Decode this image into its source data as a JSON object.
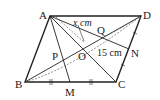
{
  "figure": {
    "type": "parallelogram",
    "points": {
      "A": {
        "label": "A",
        "x": 50,
        "y": 16
      },
      "B": {
        "label": "B",
        "x": 25,
        "y": 82
      },
      "C": {
        "label": "C",
        "x": 116,
        "y": 82
      },
      "D": {
        "label": "D",
        "x": 141,
        "y": 16
      },
      "M": {
        "label": "M",
        "x": 70,
        "y": 82
      },
      "N": {
        "label": "N",
        "x": 129,
        "y": 49
      },
      "O": {
        "label": "O",
        "x": 83,
        "y": 49
      },
      "P": {
        "label": "P",
        "x": 63,
        "y": 60
      },
      "Q": {
        "label": "Q",
        "x": 101,
        "y": 38
      }
    },
    "measurements": {
      "x_label": "x cm",
      "length_label": "15 cm"
    },
    "colors": {
      "stroke": "#222222",
      "background": "#ffffff"
    }
  }
}
